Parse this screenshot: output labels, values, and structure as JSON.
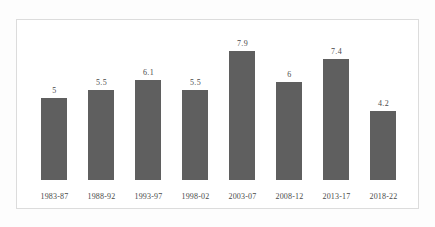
{
  "chart_data": {
    "type": "bar",
    "title": "",
    "subtitle": "",
    "xlabel": "",
    "ylabel": "",
    "ylim": [
      0,
      7.9
    ],
    "grid": false,
    "legend": null,
    "categories": [
      "1983-87",
      "1988-92",
      "1993-97",
      "1998-02",
      "2003-07",
      "2008-12",
      "2013-17",
      "2018-22"
    ],
    "values": [
      5,
      5.5,
      6.1,
      5.5,
      7.9,
      6,
      7.4,
      4.2
    ],
    "value_labels": [
      "5",
      "5.5",
      "6.1",
      "5.5",
      "7.9",
      "6",
      "7.4",
      "4.2"
    ],
    "bar_color": "#5f5f5f",
    "label_color": "#4a4a4a",
    "frame_color": "#dcdcdc",
    "background_color": "#ffffff"
  }
}
